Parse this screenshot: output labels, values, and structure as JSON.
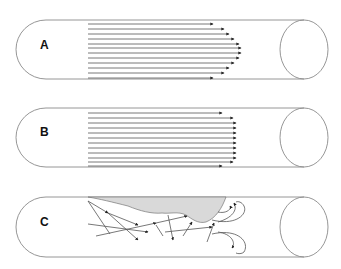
{
  "diagram": {
    "type": "flow-profiles-in-tube",
    "panels": [
      {
        "label": "A",
        "description": "Parabolic (laminar) flow profile",
        "tube": {
          "top": 20,
          "bottom": 79
        },
        "line_start_x": 88,
        "arrow_tips_x": [
          213,
          224,
          229,
          234,
          239,
          241,
          241,
          239,
          234,
          229,
          224,
          213
        ],
        "line_y": [
          24,
          29,
          34,
          39,
          44,
          48,
          53,
          58,
          63,
          68,
          73,
          78
        ]
      },
      {
        "label": "B",
        "description": "Plug (blunted) flow profile",
        "tube": {
          "top": 108,
          "bottom": 167
        },
        "line_start_x": 88,
        "arrow_tips_x": [
          222,
          233,
          236,
          236,
          236,
          236,
          236,
          236,
          236,
          236,
          233,
          222
        ],
        "line_y": [
          113,
          118,
          123,
          128,
          133,
          138,
          143,
          148,
          153,
          158,
          162,
          166
        ]
      },
      {
        "label": "C",
        "description": "Turbulent flow with obstruction (plaque)",
        "tube": {
          "top": 197,
          "bottom": 257
        }
      }
    ],
    "colors": {
      "tube_stroke": "#8a8a8a",
      "arrow": "#555555",
      "plaque_fill": "#d9d9d9",
      "label": "#111111"
    }
  }
}
